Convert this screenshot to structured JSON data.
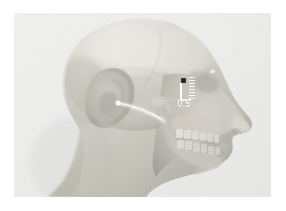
{
  "view": {
    "title": "Lateral head profile volumetric render",
    "background_color": "#ffffff",
    "canvas_color": "#ececeb",
    "subject": "human-head-lateral-translucent"
  },
  "render": {
    "modality": "3D volume rendering",
    "orientation": "right lateral (sagittal) profile, facing right",
    "visible_structures": [
      "scalp and facial soft tissue (translucent)",
      "cranial vault with sutures",
      "auricle (external ear)",
      "external auditory canal",
      "zygomatic arch",
      "maxilla with dentition",
      "mandible with dentition",
      "nasal profile",
      "cervical vertebrae"
    ],
    "tissue_color_light": "#dcdad4",
    "tissue_color_mid": "#c2bfb7",
    "tissue_color_dark": "#9b9891",
    "bone_color": "#cfcdc6"
  },
  "annotation": {
    "measurement_label": "0.5",
    "unit_implied": "cm",
    "point_marker_color": "#2a2a2a",
    "bracket_color": "#fdfdfd",
    "label_color": "#fbfbfa",
    "tick_count": 8,
    "point_name": "measurement-point",
    "scale_name": "dotted-tick-scale",
    "bracket_name": "l-bracket-ruler"
  },
  "icons": {
    "point_marker": "square-point-marker-icon",
    "ruler": "ruler-bracket-icon",
    "tick_scale": "tick-scale-icon",
    "probe": "probe-pointer-icon",
    "eye_mark": "landmark-tick-icon"
  }
}
